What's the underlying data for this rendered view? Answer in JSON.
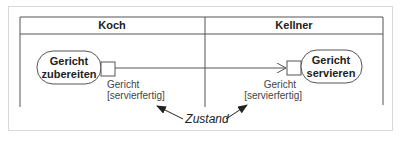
{
  "diagram": {
    "type": "uml-activity-swimlanes",
    "lanes": [
      {
        "title": "Koch"
      },
      {
        "title": "Kellner"
      }
    ],
    "actions": [
      {
        "lane": "Koch",
        "line1": "Gericht",
        "line2": "zubereiten"
      },
      {
        "lane": "Kellner",
        "line1": "Gericht",
        "line2": "servieren"
      }
    ],
    "pins": [
      {
        "attached_to": "Gericht zubereiten",
        "direction": "output",
        "name": "Gericht",
        "state": "[servierfertig]"
      },
      {
        "attached_to": "Gericht servieren",
        "direction": "input",
        "name": "Gericht",
        "state": "[servierfertig]"
      }
    ],
    "flow": {
      "from": "output-pin",
      "to": "input-pin"
    },
    "annotation": {
      "label": "Zustand",
      "points_to": [
        "[servierfertig] (left)",
        "[servierfertig] (right)"
      ]
    },
    "colors": {
      "stroke": "#555555",
      "text": "#222222",
      "frame": "#d8d8d8",
      "background": "#ffffff"
    }
  }
}
